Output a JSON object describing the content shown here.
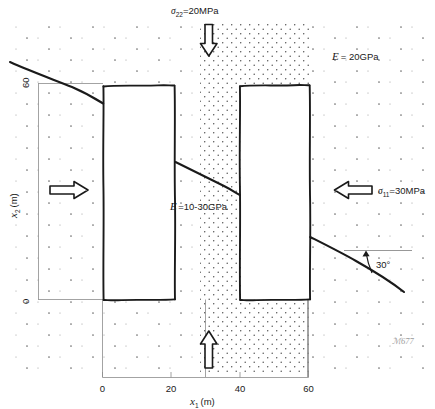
{
  "figure": {
    "type": "engineering-cross-section-diagram",
    "labels": {
      "stress_top_symbol": "σ",
      "stress_top_sub": "22",
      "stress_top_value": "=20MPa",
      "stress_top_full": "σ₂₂=20MPa",
      "stress_right_symbol": "σ",
      "stress_right_sub": "11",
      "stress_right_value": "=30MPa",
      "stress_right_full": "σ₁₁=30MPa",
      "modulus_outer_symbol": "E",
      "modulus_outer_value": "= 20GPa",
      "modulus_outer_full": "E = 20GPa",
      "modulus_band_symbol": "E",
      "modulus_band_value": "=10-30GPa",
      "modulus_band_full": "E =10-30GPa",
      "angle": "30°",
      "watermark": "ℳ677"
    },
    "axes": {
      "x": {
        "symbol": "x",
        "sub": "1",
        "unit": "(m)",
        "title": "x₁ (m)",
        "ticks": [
          "0",
          "20",
          "40",
          "60"
        ],
        "tick_values": [
          0,
          20,
          40,
          60
        ],
        "range": [
          0,
          60
        ]
      },
      "y": {
        "symbol": "x",
        "sub": "2",
        "unit": "(m)",
        "title": "x₂ (m)",
        "ticks": [
          "0",
          "60"
        ],
        "tick_values": [
          0,
          60
        ],
        "range": [
          0,
          60
        ]
      }
    },
    "regions": [
      {
        "name": "host-rock",
        "hatch": "sparse-dots",
        "modulus": "E = 20GPa"
      },
      {
        "name": "central-weak-band",
        "hatch": "dense-dots",
        "modulus": "E =10-30GPa",
        "x_from": 20,
        "x_to": 40
      }
    ],
    "openings": [
      {
        "name": "left-opening",
        "x_from": 0,
        "x_to": 20,
        "y_from": 0,
        "y_to": 60
      },
      {
        "name": "right-opening",
        "x_from": 40,
        "x_to": 60,
        "y_from": 0,
        "y_to": 60
      }
    ],
    "loads": [
      {
        "name": "top-load",
        "direction": "down",
        "magnitude": "20MPa",
        "component": "σ₂₂"
      },
      {
        "name": "bottom-load",
        "direction": "up",
        "magnitude": "20MPa",
        "component": "σ₂₂"
      },
      {
        "name": "left-load",
        "direction": "right",
        "magnitude": "30MPa",
        "component": "σ₁₁"
      },
      {
        "name": "right-load",
        "direction": "left",
        "magnitude": "30MPa",
        "component": "σ₁₁"
      }
    ],
    "fault": {
      "name": "inclined-discontinuity",
      "dip": "30°"
    },
    "colors": {
      "line": "#1a1a1a",
      "axis": "#8c8c8c",
      "dots": "#6f6f6f",
      "background": "#ffffff"
    }
  }
}
